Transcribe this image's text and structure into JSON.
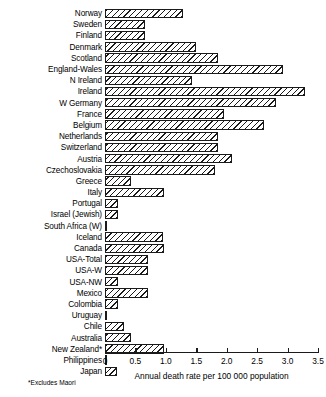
{
  "chart_data": {
    "type": "bar",
    "orientation": "horizontal",
    "title": "",
    "xlabel": "Annual death rate per 100 000 population",
    "ylabel": "",
    "xlim": [
      0,
      3.5
    ],
    "xticks": [
      "0",
      "0.5",
      "1.0",
      "1.5",
      "2.0",
      "2.5",
      "3.0",
      "3.5"
    ],
    "xtick_values": [
      0,
      0.5,
      1.0,
      1.5,
      2.0,
      2.5,
      3.0,
      3.5
    ],
    "grid": false,
    "legend": null,
    "footnote": "*Excludes Maori",
    "bar_fill": "diagonal-hatch",
    "categories": [
      "Norway",
      "Sweden",
      "Finland",
      "Denmark",
      "Scotland",
      "England-Wales",
      "N Ireland",
      "Ireland",
      "W Germany",
      "France",
      "Belgium",
      "Netherlands",
      "Switzerland",
      "Austria",
      "Czechoslovakia",
      "Greece",
      "Italy",
      "Portugal",
      "Israel (Jewish)",
      "South Africa (W)",
      "Iceland",
      "Canada",
      "USA-Total",
      "USA-W",
      "USA-NW",
      "Mexico",
      "Colombia",
      "Uruguay",
      "Chile",
      "Australia",
      "New Zealand*",
      "Philippines",
      "Japan"
    ],
    "values": [
      1.28,
      0.66,
      0.66,
      1.5,
      1.86,
      2.92,
      1.43,
      3.29,
      2.81,
      1.95,
      2.61,
      1.86,
      1.86,
      2.09,
      1.81,
      0.43,
      0.97,
      0.21,
      0.21,
      0.02,
      0.95,
      0.97,
      0.71,
      0.71,
      0.21,
      0.71,
      0.21,
      0.02,
      0.31,
      0.43,
      0.97,
      0.02,
      0.2
    ]
  }
}
